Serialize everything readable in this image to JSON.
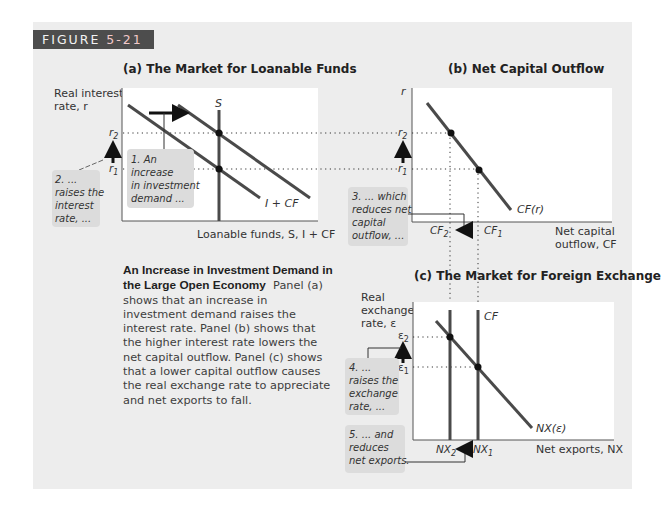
{
  "figure": {
    "label_prefix": "FIGURE",
    "label_number": "5-21"
  },
  "caption": {
    "title": "An Increase in Investment Demand in the Large Open Economy",
    "body": "Panel (a) shows that an increase in investment demand raises the interest rate. Panel (b) shows that the higher interest rate lowers the net capital outflow. Panel (c) shows that a lower capital outflow causes the real exchange rate to appreciate and net exports to fall."
  },
  "panels": {
    "a": {
      "title": "(a) The Market for Loanable Funds",
      "ylabel_line1": "Real interest",
      "ylabel_line2": "rate, r",
      "xlabel": "Loanable funds, S, I + CF",
      "supply_label": "S",
      "demand_label": "I + CF",
      "tick_r2": "r2",
      "tick_r1": "r1",
      "note1": [
        "1. An",
        "increase",
        "in investment",
        "demand ..."
      ],
      "note2": [
        "2. ...",
        "raises the",
        "interest",
        "rate, ..."
      ]
    },
    "b": {
      "title": "(b) Net Capital Outflow",
      "ylabel": "r",
      "xlabel_line1": "Net capital",
      "xlabel_line2": "outflow, CF",
      "curve_label": "CF(r)",
      "tick_r2": "r2",
      "tick_r1": "r1",
      "tick_cf2": "CF2",
      "tick_cf1": "CF1",
      "note3": [
        "3. ... which",
        "reduces net",
        "capital",
        "outflow, ..."
      ]
    },
    "c": {
      "title": "(c) The Market for Foreign Exchange",
      "ylabel_line1": "Real",
      "ylabel_line2": "exchange",
      "ylabel_line3": "rate, ε",
      "xlabel": "Net exports, NX",
      "supply_label": "CF",
      "curve_label": "NX(ε)",
      "tick_e2": "ε2",
      "tick_e1": "ε1",
      "tick_nx2": "NX2",
      "tick_nx1": "NX1",
      "note4": [
        "4. ...",
        "raises the",
        "exchange",
        "rate, ..."
      ],
      "note5": [
        "5. ... and",
        "reduces",
        "net exports."
      ]
    }
  },
  "colors": {
    "background": "#ededed",
    "plot_bg": "#ffffff",
    "curve": "#4a4a4a",
    "note_bg": "#dcdcdc",
    "label_box": "#4d4d4d"
  }
}
